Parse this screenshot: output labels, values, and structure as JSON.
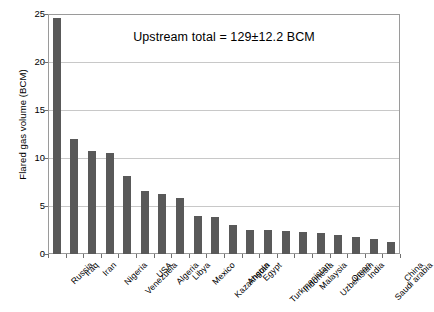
{
  "chart_data": {
    "type": "bar",
    "title": "",
    "xlabel": "",
    "ylabel": "Flared gas volume (BCM)",
    "ylim": [
      0,
      25
    ],
    "yticks": [
      0,
      5,
      10,
      15,
      20,
      25
    ],
    "ytick_labels": [
      "0",
      "5",
      "10",
      "15",
      "20",
      "25"
    ],
    "grid": true,
    "legend": null,
    "bar_color": "#595959",
    "categories": [
      "Russia",
      "Iraq",
      "Iran",
      "Nigeria",
      "Venezuela",
      "USA",
      "Algeria",
      "Libya",
      "Mexico",
      "Kazakhstan",
      "Angola",
      "Egypt",
      "Turkmenistan",
      "Indonesia",
      "Malaysia",
      "Uzbekistan",
      "Oman",
      "India",
      "Saudi arabia",
      "China"
    ],
    "values": [
      24.6,
      12.0,
      10.7,
      10.5,
      8.1,
      6.6,
      6.2,
      5.8,
      4.0,
      3.9,
      3.0,
      2.5,
      2.5,
      2.4,
      2.3,
      2.2,
      2.0,
      1.8,
      1.6,
      1.3
    ],
    "annotations": [
      {
        "text": "Upstream total = 129±12.2 BCM",
        "x_frac": 0.5,
        "y_value": 22.5
      }
    ]
  },
  "axes": {
    "y_title": "Flared gas volume (BCM)"
  }
}
